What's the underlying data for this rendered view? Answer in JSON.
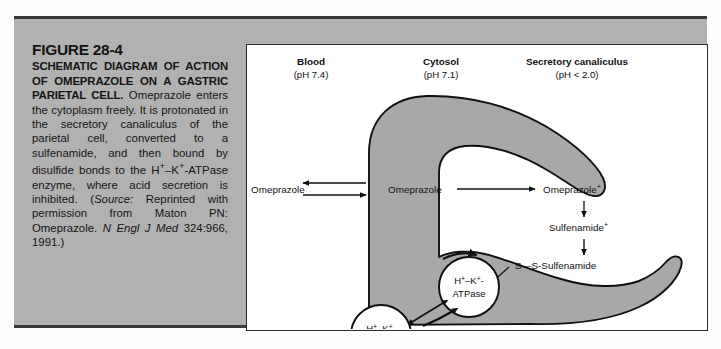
{
  "figure": {
    "number": "FIGURE 28-4",
    "title": "SCHEMATIC DIAGRAM OF ACTION OF OMEPRAZOLE ON A GASTRIC PARIETAL CELL.",
    "body": " Omeprazole enters the cytoplasm freely. It is protonated in the secretory canaliculus of the parietal cell, converted to a sulfenamide, and then bound by disulfide bonds to the H",
    "body_sup1": "+",
    "body_mid1": "–K",
    "body_sup2": "+",
    "body_mid2": "-ATPase enzyme, where acid secretion is inhibited. (",
    "source_label": "Source:",
    "source_text": " Reprinted with permission from Maton PN: Omeprazole. ",
    "journal": "N Engl J Med",
    "citation": " 324:966, 1991.)"
  },
  "diagram": {
    "columns": [
      {
        "name": "Blood",
        "ph": "(pH 7.4)"
      },
      {
        "name": "Cytosol",
        "ph": "(pH 7.1)"
      },
      {
        "name": "Secretory canaliculus",
        "ph": "(pH < 2.0)"
      }
    ],
    "labels": {
      "omeprazole_blood": "Omeprazole",
      "omeprazole_cytosol": "Omeprazole",
      "omeprazole_protonated": "Omeprazole",
      "omeprazole_protonated_sup": "+",
      "sulfenamide": "Sulfenamide",
      "sulfenamide_sup": "+",
      "disulfide": "S—S-Sulfenamide",
      "pump_h": "H",
      "pump_h_sup": "+",
      "pump_dash": "–",
      "pump_k": "K",
      "pump_k_sup": "+",
      "pump_tail": "-",
      "pump_atpase": "ATPase"
    },
    "colors": {
      "panel_background": "#b1b1b1",
      "cell_fill": "#a8a8a8",
      "diagram_background": "#ffffff",
      "stroke": "#101010",
      "rule": "#3a3a3a"
    }
  }
}
